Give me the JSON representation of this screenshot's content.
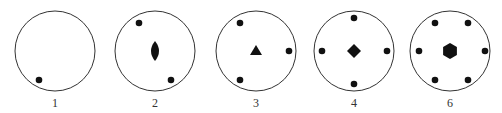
{
  "diagrams": [
    {
      "label": "1",
      "cx": 55,
      "cy": 51,
      "center_symbol": "none",
      "dots": [
        [
          39,
          80
        ]
      ]
    },
    {
      "label": "2",
      "cx": 155,
      "cy": 51,
      "center_symbol": "lens",
      "dots": [
        [
          139,
          23
        ],
        [
          171,
          80
        ]
      ]
    },
    {
      "label": "3",
      "cx": 256,
      "cy": 51,
      "center_symbol": "triangle",
      "dots": [
        [
          240,
          23
        ],
        [
          289,
          51
        ],
        [
          240,
          80
        ]
      ]
    },
    {
      "label": "4",
      "cx": 354,
      "cy": 51,
      "center_symbol": "diamond",
      "dots": [
        [
          354,
          18
        ],
        [
          387,
          51
        ],
        [
          354,
          84
        ],
        [
          322,
          51
        ]
      ]
    },
    {
      "label": "6",
      "cx": 450,
      "cy": 51,
      "center_symbol": "hexagon",
      "dots": [
        [
          435,
          23
        ],
        [
          468,
          23
        ],
        [
          485,
          51
        ],
        [
          468,
          80
        ],
        [
          435,
          80
        ],
        [
          419,
          51
        ]
      ]
    }
  ],
  "colors": {
    "stroke": "#333333",
    "fill": "#111111"
  }
}
